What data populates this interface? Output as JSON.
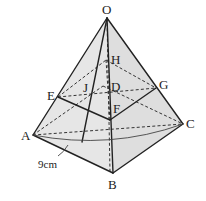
{
  "diagram": {
    "type": "pyramid-cross-section",
    "fill_color": "#e4e4e4",
    "line_color": "#222222",
    "vertices": {
      "O": "O",
      "A": "A",
      "B": "B",
      "C": "C",
      "D": "D",
      "E": "E",
      "F": "F",
      "G": "G",
      "H": "H",
      "J": "J"
    },
    "measurement": "9cm"
  }
}
